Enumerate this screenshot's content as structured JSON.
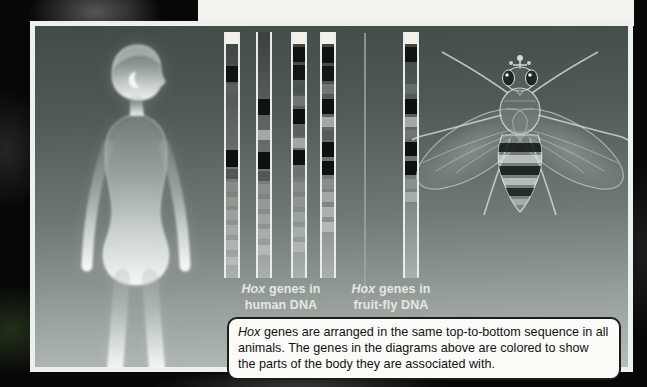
{
  "page": {
    "caption": {
      "hox_italic": "Hox",
      "body": " genes are arranged in the same top-to-bottom sequence in all animals. The genes in the diagrams above are colored to show the parts of the body they are associated with."
    },
    "labels": {
      "human": {
        "hox": "Hox",
        "line1_rest": " genes in",
        "line2": "human DNA"
      },
      "fly": {
        "hox": "Hox",
        "line1_rest": " genes in",
        "line2": "fruit-fly DNA"
      }
    },
    "colors": {
      "panel_border": "#eef0ec",
      "rail": "#e9ece8",
      "divider": "#9fa8a4",
      "caption_bg": "#fbfbf8",
      "caption_border": "#1c1c1c",
      "label_text": "#e3e8e4",
      "segment_black": "#0e1110",
      "segment_white": "#f3f1e6"
    },
    "gene_bars": {
      "track": {
        "top": 6,
        "height": 246,
        "width": 16
      },
      "human_bars": [
        {
          "x": 189,
          "segments": [
            {
              "t": 0,
              "h": 12,
              "c": "#f3f1e6"
            },
            {
              "t": 34,
              "h": 16,
              "c": "#101312"
            },
            {
              "t": 52,
              "h": 11,
              "c": "#5a605d"
            },
            {
              "t": 118,
              "h": 17,
              "c": "#0e1110"
            },
            {
              "t": 137,
              "h": 10,
              "c": "#515754"
            },
            {
              "t": 150,
              "h": 10,
              "c": "#868c88"
            },
            {
              "t": 165,
              "h": 9,
              "c": "#91978f"
            },
            {
              "t": 178,
              "h": 10,
              "c": "#9aa09b"
            },
            {
              "t": 193,
              "h": 10,
              "c": "#a4aaa5"
            },
            {
              "t": 208,
              "h": 10,
              "c": "#adb3ae"
            },
            {
              "t": 225,
              "h": 8,
              "c": "#b5bbb6"
            }
          ]
        },
        {
          "x": 221,
          "segments": [
            {
              "t": 67,
              "h": 16,
              "c": "#101312"
            },
            {
              "t": 85,
              "h": 10,
              "c": "#5e6461"
            },
            {
              "t": 98,
              "h": 10,
              "c": "#a2a8a3"
            },
            {
              "t": 120,
              "h": 17,
              "c": "#0e1110"
            },
            {
              "t": 139,
              "h": 10,
              "c": "#525855"
            },
            {
              "t": 152,
              "h": 10,
              "c": "#898f8b"
            },
            {
              "t": 167,
              "h": 10,
              "c": "#949a96"
            },
            {
              "t": 182,
              "h": 10,
              "c": "#9ea4a0"
            },
            {
              "t": 197,
              "h": 10,
              "c": "#a8aea9"
            },
            {
              "t": 213,
              "h": 10,
              "c": "#b2b8b3"
            }
          ]
        },
        {
          "x": 256,
          "segments": [
            {
              "t": 0,
              "h": 12,
              "c": "#f3f1e6"
            },
            {
              "t": 15,
              "h": 15,
              "c": "#101312"
            },
            {
              "t": 33,
              "h": 15,
              "c": "#131615"
            },
            {
              "t": 52,
              "h": 10,
              "c": "#4c5250"
            },
            {
              "t": 64,
              "h": 10,
              "c": "#6f7572"
            },
            {
              "t": 77,
              "h": 15,
              "c": "#0e1110"
            },
            {
              "t": 94,
              "h": 10,
              "c": "#5b615e"
            },
            {
              "t": 106,
              "h": 10,
              "c": "#a0a6a2"
            },
            {
              "t": 118,
              "h": 15,
              "c": "#0e1110"
            },
            {
              "t": 135,
              "h": 10,
              "c": "#6c7270"
            },
            {
              "t": 150,
              "h": 10,
              "c": "#858b87"
            },
            {
              "t": 165,
              "h": 10,
              "c": "#90968f"
            },
            {
              "t": 180,
              "h": 10,
              "c": "#9ca29d"
            },
            {
              "t": 195,
              "h": 10,
              "c": "#a6aca7"
            },
            {
              "t": 210,
              "h": 10,
              "c": "#afb5b0"
            }
          ]
        },
        {
          "x": 285,
          "segments": [
            {
              "t": 0,
              "h": 12,
              "c": "#f3f1e6"
            },
            {
              "t": 15,
              "h": 16,
              "c": "#101312"
            },
            {
              "t": 34,
              "h": 15,
              "c": "#131615"
            },
            {
              "t": 52,
              "h": 10,
              "c": "#717774"
            },
            {
              "t": 67,
              "h": 15,
              "c": "#0e1110"
            },
            {
              "t": 85,
              "h": 10,
              "c": "#a3a9a4"
            },
            {
              "t": 98,
              "h": 10,
              "c": "#565c59"
            },
            {
              "t": 110,
              "h": 15,
              "c": "#0e1110"
            },
            {
              "t": 129,
              "h": 14,
              "c": "#0e1110"
            },
            {
              "t": 147,
              "h": 10,
              "c": "#888e8a"
            },
            {
              "t": 160,
              "h": 10,
              "c": "#a1a7a2"
            },
            {
              "t": 175,
              "h": 10,
              "c": "#abb1ac"
            },
            {
              "t": 190,
              "h": 10,
              "c": "#b3b9b4"
            }
          ]
        }
      ],
      "fly_bars": [
        {
          "x": 368,
          "segments": [
            {
              "t": 0,
              "h": 12,
              "c": "#f3f1e6"
            },
            {
              "t": 15,
              "h": 15,
              "c": "#101312"
            },
            {
              "t": 52,
              "h": 10,
              "c": "#666c69"
            },
            {
              "t": 67,
              "h": 15,
              "c": "#0e1110"
            },
            {
              "t": 85,
              "h": 10,
              "c": "#a3a9a4"
            },
            {
              "t": 98,
              "h": 9,
              "c": "#707673"
            },
            {
              "t": 110,
              "h": 14,
              "c": "#0e1110"
            },
            {
              "t": 129,
              "h": 14,
              "c": "#0e1110"
            },
            {
              "t": 147,
              "h": 10,
              "c": "#8b918d"
            },
            {
              "t": 160,
              "h": 10,
              "c": "#a6aca7"
            }
          ]
        }
      ]
    }
  }
}
